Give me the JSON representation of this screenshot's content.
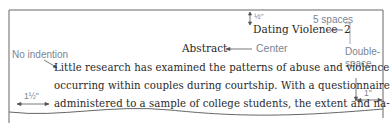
{
  "document": {
    "running_head": "Dating Violence",
    "page_number": "2",
    "heading": "Abstract",
    "body_lines": [
      "Little research has examined the patterns of abuse and violence",
      "occurring within couples during courtship. With a questionnaire",
      "administered to a sample of college students, the extent and na-"
    ]
  },
  "annotations": {
    "top_margin": "½\"",
    "five_spaces": "5 spaces",
    "center": "Center",
    "no_indention": "No indention",
    "double_space_line1": "Double-",
    "double_space_line2": "space",
    "left_margin": "1½\"",
    "right_margin": "1\""
  },
  "colors": {
    "text": "#2a2a2a",
    "annotation": "#7a8592",
    "page_border": "#555555"
  }
}
